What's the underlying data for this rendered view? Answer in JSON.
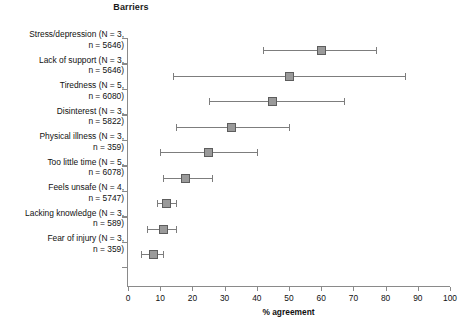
{
  "chart_data": {
    "type": "scatter",
    "title": "Barriers",
    "xlabel": "% agreement",
    "ylabel": "",
    "xlim": [
      0,
      100
    ],
    "xticks": [
      0,
      10,
      20,
      30,
      40,
      50,
      60,
      70,
      80,
      90,
      100
    ],
    "grid": false,
    "legend": null,
    "orientation": "horizontal",
    "marker_style": "square",
    "error_bars": "horizontal range with caps",
    "categories": [
      "Stress/depression (N = 3, n = 5646)",
      "Lack of support (N = 3, n = 5646)",
      "Tiredness (N = 5, n = 6080)",
      "Disinterest (N = 3, n = 5822)",
      "Physical illness (N = 3, n = 359)",
      "Too little time (N = 5, n = 6078)",
      "Feels unsafe (N = 4, n = 5747)",
      "Lacking knowledge (N = 3, n = 589)",
      "Fear of injury (N = 3, n = 359)"
    ],
    "points": [
      {
        "label_line1": "Stress/depression (N = 3,",
        "label_line2": "n = 5646)",
        "name": "Stress/depression",
        "N": 3,
        "n": 5646,
        "value": 60,
        "low": 42,
        "high": 77
      },
      {
        "label_line1": "Lack of support (N = 3,",
        "label_line2": "n = 5646)",
        "name": "Lack of support",
        "N": 3,
        "n": 5646,
        "value": 50,
        "low": 14,
        "high": 86
      },
      {
        "label_line1": "Tiredness (N = 5,",
        "label_line2": "n = 6080)",
        "name": "Tiredness",
        "N": 5,
        "n": 6080,
        "value": 45,
        "low": 25,
        "high": 67
      },
      {
        "label_line1": "Disinterest (N = 3,",
        "label_line2": "n = 5822)",
        "name": "Disinterest",
        "N": 3,
        "n": 5822,
        "value": 32,
        "low": 15,
        "high": 50
      },
      {
        "label_line1": "Physical illness (N = 3,",
        "label_line2": "n = 359)",
        "name": "Physical illness",
        "N": 3,
        "n": 359,
        "value": 25,
        "low": 10,
        "high": 40
      },
      {
        "label_line1": "Too little time (N = 5,",
        "label_line2": "n = 6078)",
        "name": "Too little time",
        "N": 5,
        "n": 6078,
        "value": 18,
        "low": 11,
        "high": 26
      },
      {
        "label_line1": "Feels unsafe (N = 4,",
        "label_line2": "n = 5747)",
        "name": "Feels unsafe",
        "N": 4,
        "n": 5747,
        "value": 12,
        "low": 9,
        "high": 15
      },
      {
        "label_line1": "Lacking knowledge (N = 3,",
        "label_line2": "n = 589)",
        "name": "Lacking knowledge",
        "N": 3,
        "n": 589,
        "value": 11,
        "low": 6,
        "high": 15
      },
      {
        "label_line1": "Fear of injury (N = 3,",
        "label_line2": "n = 359)",
        "name": "Fear of injury",
        "N": 3,
        "n": 359,
        "value": 8,
        "low": 4,
        "high": 11
      }
    ],
    "colors": {
      "marker_fill": "#9a9a9a",
      "marker_edge": "#5d5d5d",
      "error_bar": "#7d7d7d",
      "axis": "#8a8a8a",
      "text": "#111111",
      "background": "#ffffff"
    }
  }
}
